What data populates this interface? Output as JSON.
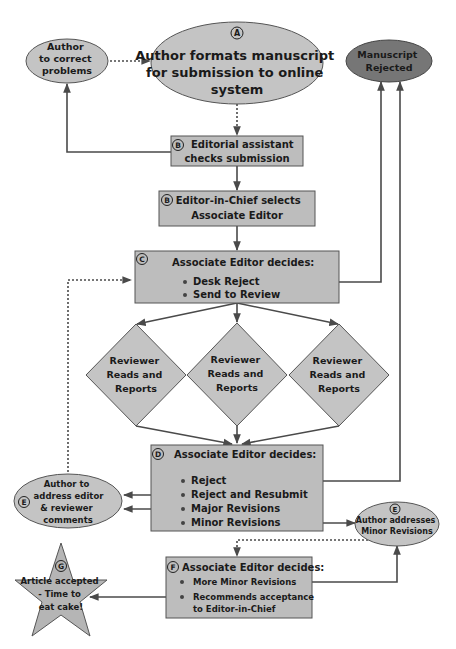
{
  "colors": {
    "node_fill": "#c4c4c4",
    "box_fill": "#bdbdbd",
    "rejected_fill": "#767676",
    "stroke": "#555555",
    "line": "#4a4a4a",
    "text": "#1a1a1a"
  },
  "nodes": {
    "author_correct": {
      "lines": [
        "Author",
        "to correct",
        "problems"
      ]
    },
    "format": {
      "badge": "A",
      "lines": [
        "Author formats manuscript",
        "for submission to online",
        "system"
      ]
    },
    "rejected": {
      "lines": [
        "Manuscript",
        "Rejected"
      ]
    },
    "assistant": {
      "badge": "B",
      "lines": [
        "Editorial assistant",
        "checks submission"
      ]
    },
    "eic": {
      "badge": "B",
      "lines": [
        "Editor-in-Chief selects",
        "Associate Editor"
      ]
    },
    "ae_c": {
      "badge": "C",
      "title": "Associate Editor decides:",
      "items": [
        "Desk Reject",
        "Send to Review"
      ]
    },
    "reviewers": [
      {
        "lines": [
          "Reviewer",
          "Reads and",
          "Reports"
        ]
      },
      {
        "lines": [
          "Reviewer",
          "Reads and",
          "Reports"
        ]
      },
      {
        "lines": [
          "Reviewer",
          "Reads and",
          "Reports"
        ]
      }
    ],
    "ae_d": {
      "badge": "D",
      "title": "Associate Editor decides:",
      "items": [
        "Reject",
        "Reject and Resubmit",
        "Major Revisions",
        "Minor Revisions"
      ]
    },
    "author_address": {
      "badge": "E",
      "lines": [
        "Author to",
        "address editor",
        "& reviewer",
        "comments"
      ]
    },
    "author_minor": {
      "badge": "E",
      "lines": [
        "Author addresses",
        "Minor Revisions"
      ]
    },
    "ae_f": {
      "badge": "F",
      "title": "Associate Editor decides:",
      "items": [
        "More Minor Revisions",
        "Recommends acceptance",
        "to Editor-in-Chief"
      ]
    },
    "accepted": {
      "badge": "G",
      "lines": [
        "Article accepted",
        "- Time to",
        "eat cake!"
      ]
    }
  }
}
